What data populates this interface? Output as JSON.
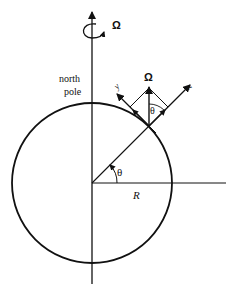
{
  "figure": {
    "labels": {
      "omega_top": "Ω",
      "omega_local": "Ω",
      "north_pole_line1": "north",
      "north_pole_line2": "pole",
      "y_axis": "y",
      "z_axis": "z",
      "theta_local": "θ",
      "theta_center": "θ",
      "radius": "R"
    },
    "geometry": {
      "circle_center": [
        92,
        183
      ],
      "circle_radius": 80,
      "latitude_deg": 45
    },
    "colors": {
      "stroke": "#111111",
      "background": "#ffffff"
    }
  }
}
